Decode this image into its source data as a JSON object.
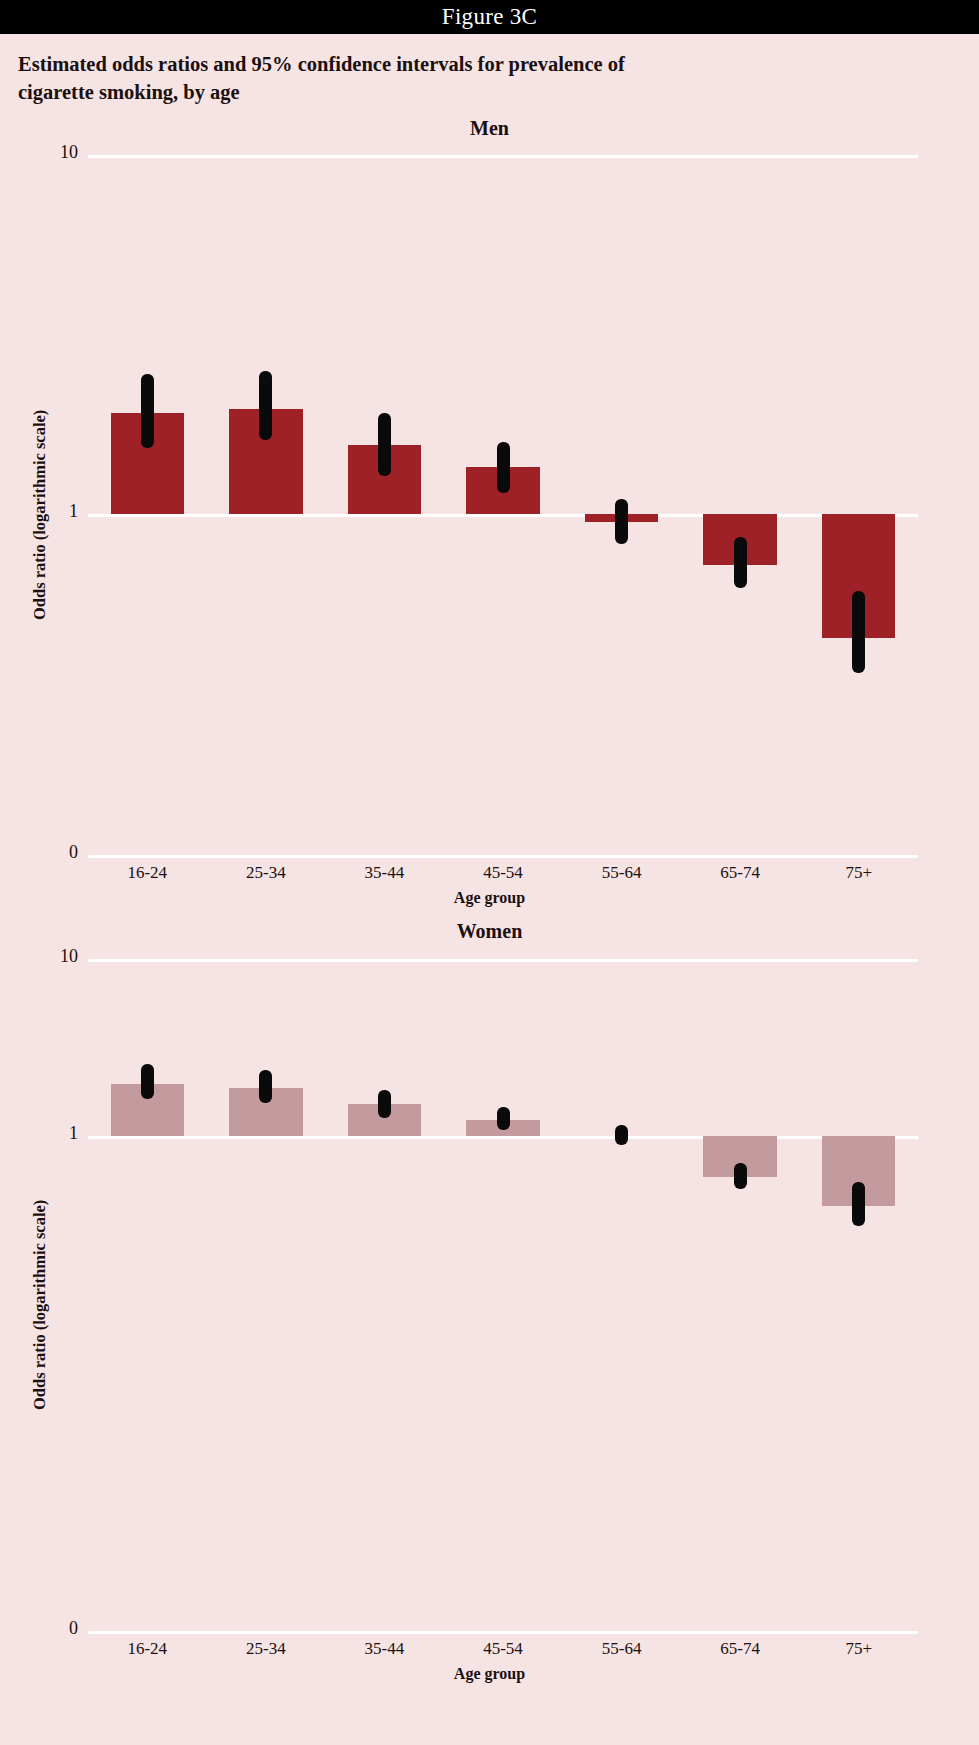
{
  "banner": {
    "figure_label": "Figure 3C"
  },
  "title": "Estimated odds ratios and 95% confidence intervals for prevalence of cigarette smoking, by age",
  "axis": {
    "y_label": "Odds ratio (logarithmic scale)",
    "x_label": "Age group",
    "y_ticks": [
      "10",
      "1",
      "0"
    ]
  },
  "colors": {
    "background": "#f6e3e3",
    "banner": "#000000",
    "men_bar": "#9e2127",
    "women_bar": "#c39a9d",
    "gridline": "#ffffff",
    "ci": "#0a0a0a"
  },
  "panels": [
    {
      "id": "men",
      "heading": "Men"
    },
    {
      "id": "women",
      "heading": "Women"
    }
  ],
  "chart_data": [
    {
      "type": "bar",
      "title": "Men",
      "xlabel": "Age group",
      "ylabel": "Odds ratio (logarithmic scale)",
      "yscale": "log",
      "ylim": [
        0,
        10
      ],
      "ytick_labels": [
        "10",
        "1",
        "0"
      ],
      "reference_line": 1,
      "grid": true,
      "categories": [
        "16-24",
        "25-34",
        "35-44",
        "45-54",
        "55-64",
        "65-74",
        "75+"
      ],
      "values": [
        1.9,
        1.95,
        1.55,
        1.35,
        0.95,
        0.72,
        0.45
      ],
      "ci_low": [
        1.52,
        1.6,
        1.27,
        1.14,
        0.82,
        0.62,
        0.36
      ],
      "ci_high": [
        2.45,
        2.5,
        1.9,
        1.58,
        1.1,
        0.86,
        0.61
      ],
      "bar_color": "#9e2127"
    },
    {
      "type": "bar",
      "title": "Women",
      "xlabel": "Age group",
      "ylabel": "Odds ratio (logarithmic scale)",
      "yscale": "log",
      "ylim": [
        0,
        10
      ],
      "ytick_labels": [
        "10",
        "1",
        "0"
      ],
      "reference_line": 1,
      "grid": true,
      "categories": [
        "16-24",
        "25-34",
        "35-44",
        "45-54",
        "55-64",
        "65-74",
        "75+"
      ],
      "values": [
        1.95,
        1.85,
        1.5,
        1.22,
        1.0,
        0.58,
        0.4
      ],
      "ci_low": [
        1.6,
        1.53,
        1.26,
        1.07,
        0.88,
        0.5,
        0.31
      ],
      "ci_high": [
        2.55,
        2.35,
        1.82,
        1.45,
        1.15,
        0.7,
        0.55
      ],
      "bar_color": "#c39a9d"
    }
  ]
}
